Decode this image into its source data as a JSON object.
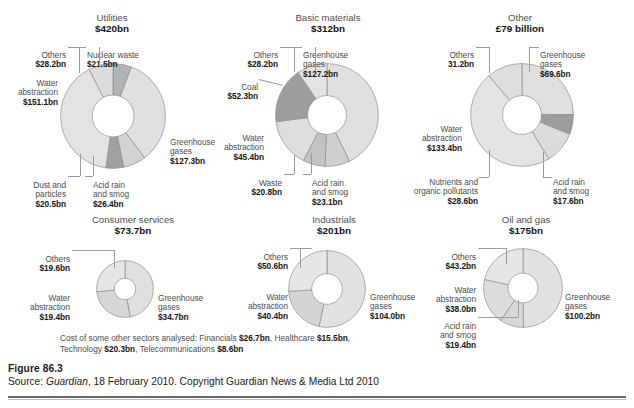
{
  "figure": {
    "number": "Figure 86.3",
    "source_prefix": "Source: ",
    "source_italic": "Guardian",
    "source_rest": ", 18 February 2010. Copyright Guardian News & Media Ltd 2010"
  },
  "footnote": {
    "line1_text": "Cost of some other sectors analysed: Financials ",
    "line1_v1": "$26.7bn",
    "line1_mid": ", Healthcare ",
    "line1_v2": "$15.5bn",
    "line1_end": ",",
    "line2_text": "Technology ",
    "line2_v1": "$20.3bn",
    "line2_mid": ", Telecommunications ",
    "line2_v2": "$8.6bn"
  },
  "chart_data": [
    {
      "type": "pie",
      "id": "utilities",
      "title": "Utilities",
      "total": "$420bn",
      "labels": [
        "Nuclear waste",
        "Greenhouse gases",
        "Acid rain and smog",
        "Dust and particles",
        "Water abstraction",
        "Others"
      ],
      "values": [
        21.5,
        127.3,
        26.4,
        20.5,
        151.1,
        28.2
      ],
      "value_labels": [
        "$21.5bn",
        "$127.3bn",
        "$26.4bn",
        "$20.5bn",
        "$151.1bn",
        "$28.2bn"
      ],
      "shades": [
        "#b3b3b3",
        "#e0e0e0",
        "#d2d2d2",
        "#a0a0a0",
        "#e3e3e3",
        "#dcdcdc"
      ]
    },
    {
      "type": "pie",
      "id": "basic-materials",
      "title": "Basic materials",
      "total": "$312bn",
      "labels": [
        "Greenhouse gases",
        "Acid rain and smog",
        "Waste",
        "Water abstraction",
        "Coal",
        "Others"
      ],
      "values": [
        127.2,
        23.1,
        20.8,
        45.4,
        52.3,
        28.2
      ],
      "value_labels": [
        "$127.2bn",
        "$23.1bn",
        "$20.8bn",
        "$45.4bn",
        "$52.3bn",
        "$28.2bn"
      ],
      "shades": [
        "#e0e0e0",
        "#cfcfcf",
        "#c2c2c2",
        "#dedede",
        "#9d9d9d",
        "#e3e3e3"
      ]
    },
    {
      "type": "pie",
      "id": "other",
      "title": "Other",
      "total": "£79 billion",
      "labels": [
        "Greenhouse gases",
        "Acid rain and smog",
        "Nutrients and organic pollutants",
        "Water abstraction",
        "Others"
      ],
      "values": [
        69.6,
        17.6,
        28.6,
        133.4,
        31.2
      ],
      "value_labels": [
        "$69.6bn",
        "$17.6bn",
        "$28.6bn",
        "$133.4bn",
        "31.2bn"
      ],
      "shades": [
        "#e0e0e0",
        "#9d9d9d",
        "#dcdcdc",
        "#e4e4e4",
        "#dedede"
      ]
    },
    {
      "type": "pie",
      "id": "consumer-services",
      "title": "Consumer services",
      "total": "$73.7bn",
      "labels": [
        "Greenhouse gases",
        "Water abstraction",
        "Others"
      ],
      "values": [
        34.7,
        19.4,
        19.6
      ],
      "value_labels": [
        "$34.7bn",
        "$19.4bn",
        "$19.6bn"
      ],
      "shades": [
        "#e0e0e0",
        "#d6d6d6",
        "#e6e6e6"
      ]
    },
    {
      "type": "pie",
      "id": "industrials",
      "title": "Industrials",
      "total": "$201bn",
      "labels": [
        "Greenhouse gases",
        "Water abstraction",
        "Others"
      ],
      "values": [
        104.0,
        40.4,
        50.6
      ],
      "value_labels": [
        "$104.0bn",
        "$40.4bn",
        "$50.6bn"
      ],
      "shades": [
        "#e2e2e2",
        "#d4d4d4",
        "#e7e7e7"
      ]
    },
    {
      "type": "pie",
      "id": "oil-and-gas",
      "title": "Oil and gas",
      "total": "$175bn",
      "labels": [
        "Greenhouse gases",
        "Acid rain and smog",
        "Water abstraction",
        "Others"
      ],
      "values": [
        100.2,
        19.4,
        38.0,
        43.2
      ],
      "value_labels": [
        "$100.2bn",
        "$19.4bn",
        "$38.0bn",
        "$43.2bn"
      ],
      "shades": [
        "#e2e2e2",
        "#d8d8d8",
        "#dcdcdc",
        "#e7e7e7"
      ]
    }
  ],
  "callouts": {
    "utilities": {
      "title": "Utilities",
      "total": "$420bn",
      "others": "Others",
      "others_v": "$28.2bn",
      "nuclear": "Nuclear waste",
      "nuclear_v": "$21.5bn",
      "water": "Water\nabstraction",
      "water_v": "$151.1bn",
      "ghg": "Greenhouse\ngases",
      "ghg_v": "$127.3bn",
      "dust": "Dust and\nparticles",
      "dust_v": "$20.5bn",
      "acid": "Acid rain\nand smog",
      "acid_v": "$26.4bn"
    },
    "basic": {
      "title": "Basic materials",
      "total": "$312bn",
      "others": "Others",
      "others_v": "$28.2bn",
      "ghg": "Greenhouse\ngases",
      "ghg_v": "$127.2bn",
      "coal": "Coal",
      "coal_v": "$52.3bn",
      "water": "Water\nabstraction",
      "water_v": "$45.4bn",
      "waste": "Waste",
      "waste_v": "$20.8bn",
      "acid": "Acid rain\nand smog",
      "acid_v": "$23.1bn"
    },
    "other": {
      "title": "Other",
      "total": "£79 billion",
      "others": "Others",
      "others_v": "31.2bn",
      "ghg": "Greenhouse\ngases",
      "ghg_v": "$69.6bn",
      "water": "Water\nabstraction",
      "water_v": "$133.4bn",
      "nutrients": "Nutrients and\norganic pollutants",
      "nutrients_v": "$28.6bn",
      "acid": "Acid rain\nand smog",
      "acid_v": "$17.6bn"
    },
    "consumer": {
      "title": "Consumer services",
      "total": "$73.7bn",
      "others": "Others",
      "others_v": "$19.6bn",
      "water": "Water\nabstraction",
      "water_v": "$19.4bn",
      "ghg": "Greenhouse\ngases",
      "ghg_v": "$34.7bn"
    },
    "industrials": {
      "title": "Industrials",
      "total": "$201bn",
      "others": "Others",
      "others_v": "$50.6bn",
      "water": "Water\nabstraction",
      "water_v": "$40.4bn",
      "ghg": "Greenhouse\ngases",
      "ghg_v": "$104.0bn"
    },
    "oil": {
      "title": "Oil and gas",
      "total": "$175bn",
      "others": "Others",
      "others_v": "$43.2bn",
      "water": "Water\nabstraction",
      "water_v": "$38.0bn",
      "ghg": "Greenhouse\ngases",
      "ghg_v": "$100.2bn",
      "acid": "Acid rain\nand smog",
      "acid_v": "$19.4bn"
    }
  }
}
